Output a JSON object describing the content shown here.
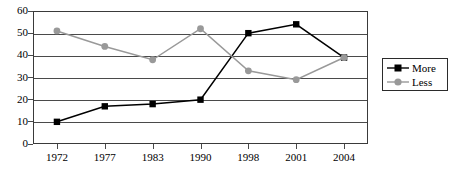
{
  "chart_data": {
    "type": "line",
    "title": "",
    "xlabel": "",
    "ylabel": "",
    "categories": [
      "1972",
      "1977",
      "1983",
      "1990",
      "1998",
      "2001",
      "2004"
    ],
    "ylim": [
      0,
      60
    ],
    "yticks": [
      "0",
      "10",
      "20",
      "30",
      "40",
      "50",
      "60"
    ],
    "grid": true,
    "legend_position": "right",
    "series": [
      {
        "name": "More",
        "color": "#000000",
        "marker": "square",
        "values": [
          10,
          17,
          18,
          20,
          50,
          54,
          39
        ]
      },
      {
        "name": "Less",
        "color": "#999999",
        "marker": "circle",
        "values": [
          51,
          44,
          38,
          52,
          33,
          29,
          39
        ]
      }
    ]
  },
  "legend": {
    "items": [
      {
        "label": "More"
      },
      {
        "label": "Less"
      }
    ]
  },
  "colors": {
    "more_series": "#000000",
    "less_series": "#999999",
    "axis": "#4a4a4a",
    "frame": "#3a3a3a",
    "background": "#ffffff"
  }
}
